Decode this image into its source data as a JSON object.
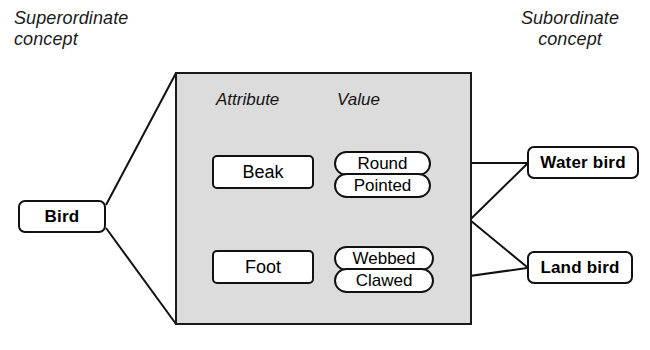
{
  "diagram": {
    "title_superordinate": "Superordinate\nconcept",
    "title_subordinate": "Subordinate\nconcept",
    "panel": {
      "column_headers": [
        "Attribute",
        "Value"
      ]
    },
    "superordinate": {
      "label": "Bird"
    },
    "attributes": [
      {
        "label": "Beak",
        "values": [
          "Round",
          "Pointed"
        ]
      },
      {
        "label": "Foot",
        "values": [
          "Webbed",
          "Clawed"
        ]
      }
    ],
    "subordinates": [
      {
        "label": "Water bird"
      },
      {
        "label": "Land bird"
      }
    ],
    "links": [
      {
        "from": "Round",
        "to": "Water bird"
      },
      {
        "from": "Webbed",
        "to": "Water bird"
      },
      {
        "from": "Pointed",
        "to": "Land bird"
      },
      {
        "from": "Clawed",
        "to": "Land bird"
      }
    ],
    "bidirectional_relation": {
      "from": "Beak",
      "to": "Foot"
    },
    "colors": {
      "panel_fill": "#dcdcdc",
      "stroke": "#111111",
      "box_fill": "#ffffff",
      "background": "#ffffff"
    }
  }
}
